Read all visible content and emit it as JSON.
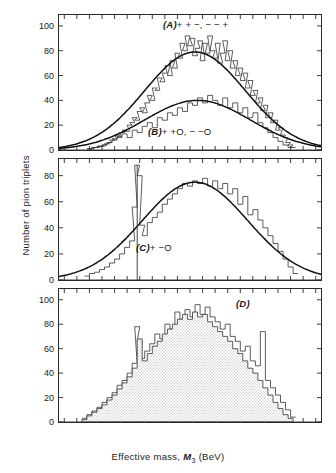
{
  "figure": {
    "xlabel_prefix": "Effective   mass,  ",
    "xlabel_symbol": "M",
    "xlabel_sub": "3",
    "xlabel_unit": " (BeV)",
    "ylabel": "Number of pion triplets",
    "x_tick_labels": [
      "0·2",
      "0·4",
      "0·6",
      "0·8",
      "1·0",
      "1·2",
      "1·4",
      "1·6",
      "1·8",
      "2·0",
      "2·2"
    ],
    "x_tick_values": [
      0.2,
      0.4,
      0.6,
      0.8,
      1.0,
      1.2,
      1.4,
      1.6,
      1.8,
      2.0,
      2.2
    ],
    "minor_tick_step": 0.1,
    "label_a": "(A)+  +  −,  − − +",
    "label_b": "(B)+ +O, − −O",
    "label_c": "(C)+ −O",
    "label_d": "(D)",
    "axis_color": "#2a2a2a",
    "curve_color": "#111111",
    "hist_color": "#333333",
    "shade_color": "#c9c9c9"
  },
  "chart_data": {
    "type": "line",
    "title": "",
    "xlabel": "Effective mass, M3 (BeV)",
    "ylabel": "Number of pion triplets",
    "xlim": [
      0.15,
      2.25
    ],
    "grid": false,
    "legend": "none",
    "bin_width": 0.02,
    "panels": [
      {
        "id": "A",
        "label": "(A)+  +  −,  − − +",
        "ylim": [
          0,
          108
        ],
        "yticks": [
          0,
          20,
          40,
          60,
          80,
          100
        ],
        "series": [
          {
            "name": "++-, --+ histogram",
            "type": "step",
            "x": [
              0.38,
              0.4,
              0.42,
              0.44,
              0.46,
              0.48,
              0.5,
              0.52,
              0.54,
              0.56,
              0.58,
              0.6,
              0.62,
              0.64,
              0.66,
              0.68,
              0.7,
              0.72,
              0.74,
              0.76,
              0.78,
              0.8,
              0.82,
              0.84,
              0.86,
              0.88,
              0.9,
              0.92,
              0.94,
              0.96,
              0.98,
              1.0,
              1.02,
              1.04,
              1.06,
              1.08,
              1.1,
              1.12,
              1.14,
              1.16,
              1.18,
              1.2,
              1.22,
              1.24,
              1.26,
              1.28,
              1.3,
              1.32,
              1.34,
              1.36,
              1.38,
              1.4,
              1.42,
              1.44,
              1.46,
              1.48,
              1.5,
              1.52,
              1.54,
              1.56,
              1.58,
              1.6,
              1.62,
              1.64,
              1.66,
              1.68,
              1.7,
              1.72,
              1.74,
              1.76,
              1.78,
              1.8,
              1.82,
              1.84,
              1.86,
              1.88,
              1.9,
              1.92,
              1.94,
              1.96,
              1.98,
              2.0
            ],
            "y": [
              1,
              1,
              2,
              2,
              3,
              3,
              4,
              5,
              6,
              8,
              9,
              12,
              10,
              14,
              16,
              15,
              20,
              22,
              26,
              24,
              31,
              34,
              30,
              38,
              44,
              40,
              50,
              48,
              58,
              55,
              62,
              68,
              60,
              72,
              66,
              78,
              74,
              86,
              80,
              92,
              84,
              90,
              76,
              82,
              88,
              72,
              86,
              78,
              92,
              80,
              74,
              86,
              70,
              78,
              88,
              72,
              80,
              66,
              72,
              60,
              66,
              56,
              62,
              50,
              56,
              44,
              48,
              38,
              42,
              32,
              36,
              26,
              30,
              22,
              24,
              16,
              18,
              12,
              10,
              6,
              4,
              2
            ]
          },
          {
            "name": "++-, --+ fitted curve",
            "type": "curve",
            "peak_x": 1.24,
            "peak_y": 79,
            "sigma": 0.4
          },
          {
            "name": "++O, --O histogram",
            "type": "step",
            "x": [
              0.38,
              0.42,
              0.46,
              0.5,
              0.54,
              0.58,
              0.62,
              0.66,
              0.7,
              0.74,
              0.78,
              0.82,
              0.86,
              0.9,
              0.94,
              0.98,
              1.02,
              1.06,
              1.1,
              1.14,
              1.18,
              1.22,
              1.26,
              1.3,
              1.34,
              1.38,
              1.42,
              1.46,
              1.5,
              1.54,
              1.58,
              1.62,
              1.66,
              1.7,
              1.74,
              1.78,
              1.82,
              1.86,
              1.9,
              1.94,
              1.98
            ],
            "y": [
              1,
              2,
              3,
              4,
              6,
              8,
              11,
              13,
              10,
              16,
              14,
              19,
              22,
              18,
              26,
              24,
              30,
              28,
              34,
              31,
              38,
              36,
              42,
              38,
              44,
              40,
              36,
              42,
              34,
              38,
              30,
              34,
              26,
              30,
              22,
              18,
              14,
              10,
              7,
              4,
              2
            ]
          },
          {
            "name": "++O, --O fitted curve",
            "type": "curve",
            "peak_x": 1.26,
            "peak_y": 40,
            "sigma": 0.42
          }
        ]
      },
      {
        "id": "C",
        "label": "(C)+ −O",
        "ylim": [
          0,
          92
        ],
        "yticks": [
          0,
          20,
          40,
          60,
          80
        ],
        "series": [
          {
            "name": "+-O histogram",
            "type": "step",
            "x": [
              0.36,
              0.4,
              0.44,
              0.48,
              0.52,
              0.56,
              0.6,
              0.64,
              0.68,
              0.72,
              0.74,
              0.76,
              0.78,
              0.8,
              0.82,
              0.86,
              0.9,
              0.94,
              0.98,
              1.02,
              1.06,
              1.1,
              1.14,
              1.18,
              1.22,
              1.26,
              1.3,
              1.34,
              1.38,
              1.42,
              1.46,
              1.5,
              1.54,
              1.58,
              1.62,
              1.66,
              1.7,
              1.74,
              1.78,
              1.82,
              1.86,
              1.9,
              1.94,
              1.98,
              2.02
            ],
            "y": [
              3,
              5,
              6,
              8,
              10,
              13,
              16,
              20,
              25,
              30,
              56,
              88,
              80,
              42,
              34,
              44,
              48,
              52,
              58,
              62,
              66,
              70,
              74,
              72,
              76,
              74,
              78,
              72,
              76,
              70,
              74,
              66,
              70,
              58,
              64,
              50,
              54,
              46,
              40,
              34,
              28,
              22,
              16,
              10,
              5
            ]
          },
          {
            "name": "+-O fitted curve",
            "type": "curve",
            "peak_x": 1.24,
            "peak_y": 75,
            "sigma": 0.42
          },
          {
            "name": "omega resonance spike",
            "type": "annotation",
            "x": 0.78,
            "y": 88
          }
        ]
      },
      {
        "id": "D",
        "label": "(D)",
        "ylim": [
          0,
          108
        ],
        "yticks": [
          0,
          20,
          40,
          60,
          80,
          100
        ],
        "series": [
          {
            "name": "outline histogram",
            "type": "step",
            "x": [
              0.34,
              0.38,
              0.42,
              0.46,
              0.5,
              0.54,
              0.58,
              0.62,
              0.66,
              0.7,
              0.74,
              0.76,
              0.78,
              0.8,
              0.84,
              0.88,
              0.92,
              0.96,
              1.0,
              1.04,
              1.08,
              1.12,
              1.16,
              1.2,
              1.24,
              1.28,
              1.32,
              1.36,
              1.4,
              1.44,
              1.48,
              1.52,
              1.56,
              1.6,
              1.64,
              1.68,
              1.72,
              1.76,
              1.8,
              1.84,
              1.88,
              1.92,
              1.96,
              2.0
            ],
            "y": [
              3,
              6,
              9,
              12,
              16,
              20,
              24,
              30,
              34,
              40,
              48,
              78,
              66,
              52,
              58,
              64,
              72,
              68,
              80,
              76,
              90,
              84,
              92,
              86,
              96,
              88,
              94,
              86,
              82,
              76,
              80,
              70,
              66,
              58,
              62,
              50,
              46,
              74,
              34,
              28,
              22,
              16,
              10,
              4
            ]
          },
          {
            "name": "shaded histogram",
            "type": "step",
            "fill": true,
            "x": [
              0.34,
              0.38,
              0.42,
              0.46,
              0.5,
              0.54,
              0.58,
              0.62,
              0.66,
              0.7,
              0.74,
              0.78,
              0.82,
              0.86,
              0.9,
              0.94,
              0.98,
              1.02,
              1.06,
              1.1,
              1.14,
              1.18,
              1.22,
              1.26,
              1.3,
              1.34,
              1.38,
              1.42,
              1.46,
              1.5,
              1.54,
              1.58,
              1.62,
              1.66,
              1.7,
              1.74,
              1.78,
              1.82,
              1.86,
              1.9,
              1.94,
              1.98
            ],
            "y": [
              2,
              5,
              8,
              11,
              14,
              18,
              22,
              27,
              32,
              37,
              44,
              68,
              50,
              56,
              62,
              66,
              72,
              76,
              80,
              84,
              88,
              84,
              90,
              86,
              88,
              82,
              78,
              74,
              70,
              66,
              60,
              56,
              50,
              44,
              40,
              34,
              28,
              22,
              16,
              11,
              6,
              3
            ]
          }
        ]
      }
    ]
  }
}
